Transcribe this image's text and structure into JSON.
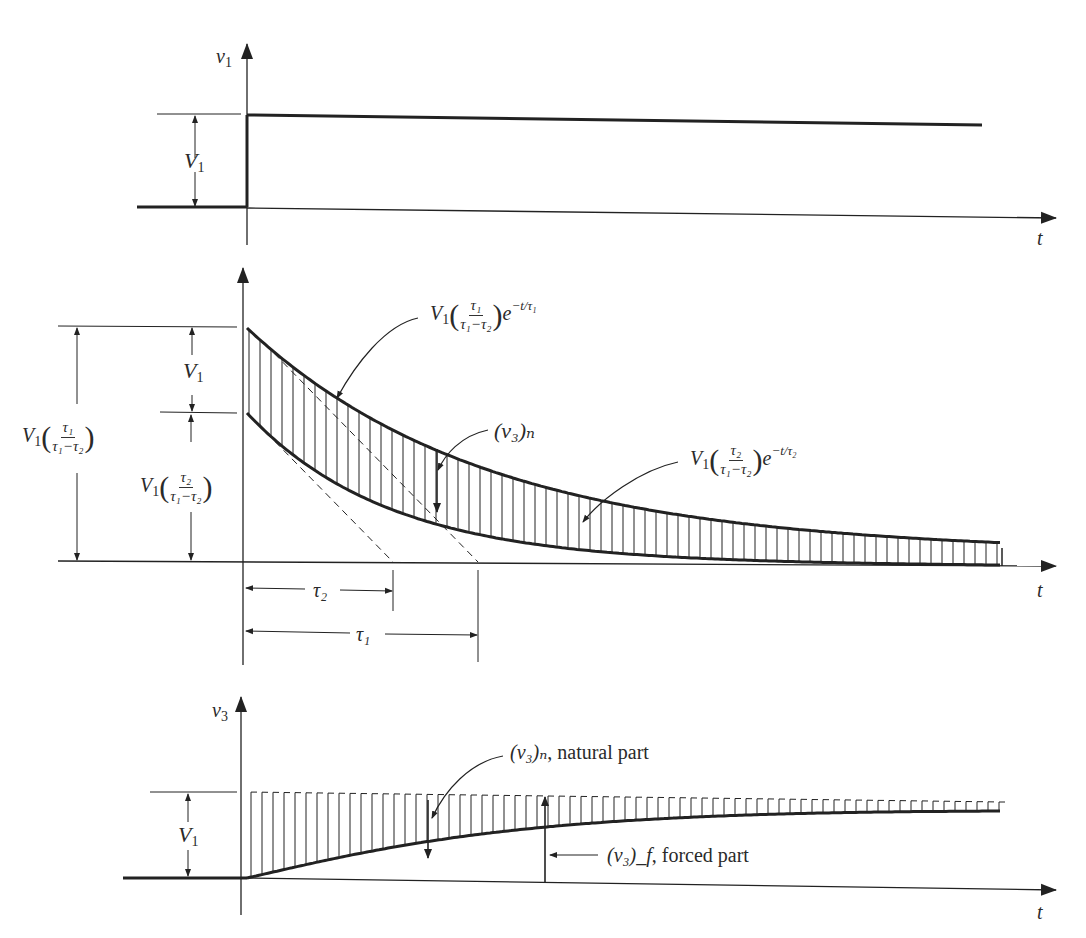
{
  "figure": {
    "panels": [
      {
        "id": "input",
        "y_axis_label": "v",
        "y_axis_sub": "1",
        "x_axis_label": "t",
        "step_height_label": "V",
        "step_height_sub": "1"
      },
      {
        "id": "components",
        "x_axis_label": "t",
        "dim_v1_label": "V",
        "dim_v1_sub": "1",
        "dim_tau1_ratio": {
          "prefix": "V",
          "prefix_sub": "1",
          "num": "τ₁",
          "den": "τ₁−τ₂"
        },
        "dim_tau2_ratio": {
          "prefix": "V",
          "prefix_sub": "1",
          "num": "τ₂",
          "den": "τ₁−τ₂"
        },
        "upper_curve_label": {
          "prefix": "V",
          "prefix_sub": "1",
          "num": "τ₁",
          "den": "τ₁−τ₂",
          "exp_base": "e",
          "exponent": "−t/τ₁"
        },
        "lower_curve_label": {
          "prefix": "V",
          "prefix_sub": "1",
          "num": "τ₂",
          "den": "τ₁−τ₂",
          "exp_base": "e",
          "exponent": "−t/τ₂"
        },
        "difference_label": "(v₃)ₙ",
        "tau2_label": "τ₂",
        "tau1_label": "τ₁"
      },
      {
        "id": "output",
        "y_axis_label": "v",
        "y_axis_sub": "3",
        "x_axis_label": "t",
        "final_value_label": "V",
        "final_value_sub": "1",
        "natural_part_label": "(v₃)ₙ",
        "natural_part_text": ", natural part",
        "forced_part_label": "(v₃)_f",
        "forced_part_text": ", forced part"
      }
    ]
  },
  "chart_data": [
    {
      "type": "line",
      "title": "Input step v1",
      "xlabel": "t",
      "ylabel": "v1",
      "series": [
        {
          "name": "v1",
          "x": [
            -1,
            0,
            0,
            10
          ],
          "values": [
            0,
            0,
            1,
            1
          ]
        }
      ],
      "annotations": [
        "V1 (step height)"
      ]
    },
    {
      "type": "area",
      "title": "Exponential components",
      "xlabel": "t",
      "ylabel": "",
      "series": [
        {
          "name": "V1(τ1/(τ1−τ2)) e^(−t/τ1)",
          "x0": 2.0,
          "tau": 1.0
        },
        {
          "name": "V1(τ2/(τ1−τ2)) e^(−t/τ2)",
          "x0": 1.0,
          "tau": 0.6
        }
      ],
      "annotations": [
        "V1",
        "V1(τ1/(τ1−τ2))",
        "V1(τ2/(τ1−τ2))",
        "(v3)n",
        "τ2",
        "τ1"
      ],
      "shaded": "difference between curves (hatched)"
    },
    {
      "type": "area",
      "title": "Output v3",
      "xlabel": "t",
      "ylabel": "v3",
      "series": [
        {
          "name": "(v3)f forced part",
          "final": 1
        },
        {
          "name": "(v3)n natural part",
          "description": "hatched region between V1 and response"
        }
      ],
      "annotations": [
        "V1",
        "(v3)n, natural part",
        "(v3)f, forced part"
      ]
    }
  ]
}
